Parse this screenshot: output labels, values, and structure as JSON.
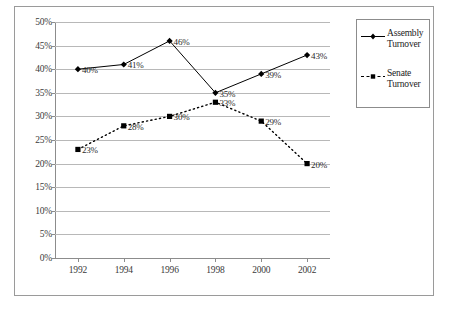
{
  "chart_data": {
    "type": "line",
    "title": "",
    "xlabel": "",
    "ylabel": "",
    "categories": [
      "1992",
      "1994",
      "1996",
      "1998",
      "2000",
      "2002"
    ],
    "ylim": [
      0,
      50
    ],
    "ytick_labels": [
      "0%",
      "5%",
      "10%",
      "15%",
      "20%",
      "25%",
      "30%",
      "35%",
      "40%",
      "45%",
      "50%"
    ],
    "ytick_values": [
      0,
      5,
      10,
      15,
      20,
      25,
      30,
      35,
      40,
      45,
      50
    ],
    "grid": true,
    "legend_position": "right",
    "series": [
      {
        "name": "Assembly Turnover",
        "marker": "diamond",
        "line_style": "solid",
        "color": "#000000",
        "values": [
          40,
          41,
          46,
          35,
          39,
          43
        ],
        "data_labels": [
          "40%",
          "41%",
          "46%",
          "35%",
          "39%",
          "43%"
        ]
      },
      {
        "name": "Senate Turnover",
        "marker": "square",
        "line_style": "dashed",
        "color": "#000000",
        "values": [
          23,
          28,
          30,
          33,
          29,
          20
        ],
        "data_labels": [
          "23%",
          "28%",
          "30%",
          "33%",
          "29%",
          "20%"
        ]
      }
    ]
  },
  "legend": {
    "items": [
      {
        "label_line1": "Assembly",
        "label_line2": "Turnover"
      },
      {
        "label_line1": "Senate",
        "label_line2": "Turnover"
      }
    ]
  }
}
